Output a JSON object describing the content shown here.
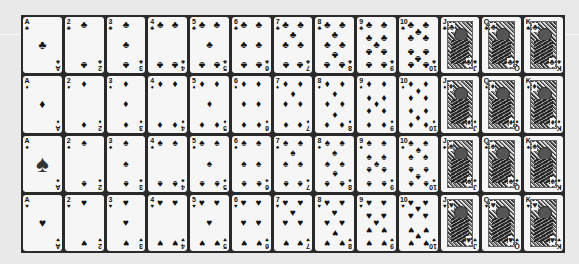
{
  "sheet": {
    "title": "Playing card deck sheet",
    "background_color": "#e9e9e9",
    "grid_color": "#2a2a2a",
    "card_color": "#f6f6f6",
    "ranks": [
      "A",
      "2",
      "3",
      "4",
      "5",
      "6",
      "7",
      "8",
      "9",
      "10",
      "J",
      "Q",
      "K"
    ],
    "rows": [
      {
        "suit": "clubs",
        "symbol": "♣"
      },
      {
        "suit": "diamonds",
        "symbol": "♦"
      },
      {
        "suit": "spades",
        "symbol": "♠"
      },
      {
        "suit": "hearts",
        "symbol": "♥"
      }
    ]
  }
}
